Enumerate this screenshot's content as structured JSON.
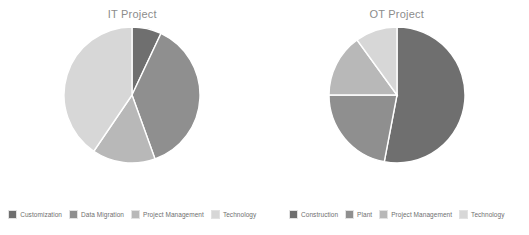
{
  "background": "#ffffff",
  "palette": {
    "dark": "#6f6f6f",
    "medium_dark": "#8f8f8f",
    "medium_light": "#b8b8b8",
    "light": "#d7d7d7",
    "divider": "#ffffff",
    "title_color": "#8c8c8c",
    "legend_text": "#6f6f6f"
  },
  "charts": [
    {
      "title": "IT Project",
      "legend": [
        {
          "label": "Customization",
          "color": "#6f6f6f"
        },
        {
          "label": "Data Migration",
          "color": "#8f8f8f"
        },
        {
          "label": "Project Management",
          "color": "#b8b8b8"
        },
        {
          "label": "Technology",
          "color": "#d7d7d7"
        }
      ]
    },
    {
      "title": "OT Project",
      "legend": [
        {
          "label": "Construction",
          "color": "#6f6f6f"
        },
        {
          "label": "Plant",
          "color": "#8f8f8f"
        },
        {
          "label": "Project Management",
          "color": "#b8b8b8"
        },
        {
          "label": "Technology",
          "color": "#d7d7d7"
        }
      ]
    }
  ],
  "chart_data": [
    {
      "type": "pie",
      "title": "IT Project",
      "categories": [
        "Customization",
        "Data Migration",
        "Project Management",
        "Technology"
      ],
      "values": [
        7,
        37.5,
        15,
        40.5
      ],
      "unit": "percent",
      "colors": [
        "#6f6f6f",
        "#8f8f8f",
        "#b8b8b8",
        "#d7d7d7"
      ],
      "start_angle": 0,
      "direction": "clockwise",
      "legend_position": "bottom",
      "grid": false
    },
    {
      "type": "pie",
      "title": "OT Project",
      "categories": [
        "Construction",
        "Plant",
        "Project Management",
        "Technology"
      ],
      "values": [
        53,
        22,
        15,
        10
      ],
      "unit": "percent",
      "colors": [
        "#6f6f6f",
        "#8f8f8f",
        "#b8b8b8",
        "#d7d7d7"
      ],
      "start_angle": 0,
      "direction": "clockwise",
      "legend_position": "bottom",
      "grid": false
    }
  ]
}
